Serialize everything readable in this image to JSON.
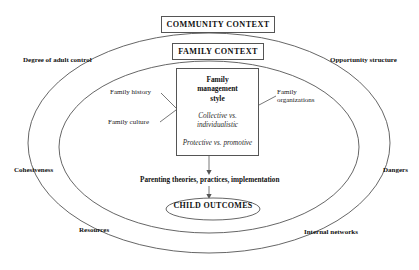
{
  "diagram": {
    "outer_context": {
      "title": "COMMUNITY CONTEXT"
    },
    "inner_context": {
      "title": "FAMILY CONTEXT"
    },
    "core": {
      "title_line_1": "Family",
      "title_line_2": "management",
      "title_line_3": "style",
      "dimension_1": "Collective vs. individualistic",
      "dimension_2": "Protective vs. promotive"
    },
    "influences": [
      {
        "label": "Family history",
        "side": "left"
      },
      {
        "label": "Family culture",
        "side": "left"
      },
      {
        "label": "Family organizations",
        "side": "right"
      }
    ],
    "flow": {
      "mediator": "Parenting theories, practices, implementation",
      "outcome": "CHILD OUTCOMES"
    },
    "community_factors": [
      {
        "label": "Degree of adult control",
        "position": "top-left"
      },
      {
        "label": "Opportunity structure",
        "position": "top-right"
      },
      {
        "label": "Cohesiveness",
        "position": "mid-left"
      },
      {
        "label": "Dangers",
        "position": "mid-right"
      },
      {
        "label": "Resources",
        "position": "bottom-left"
      },
      {
        "label": "Internal networks",
        "position": "bottom-right"
      }
    ],
    "colors": {
      "stroke": "#555555",
      "text": "#111111",
      "background": "#ffffff"
    }
  }
}
